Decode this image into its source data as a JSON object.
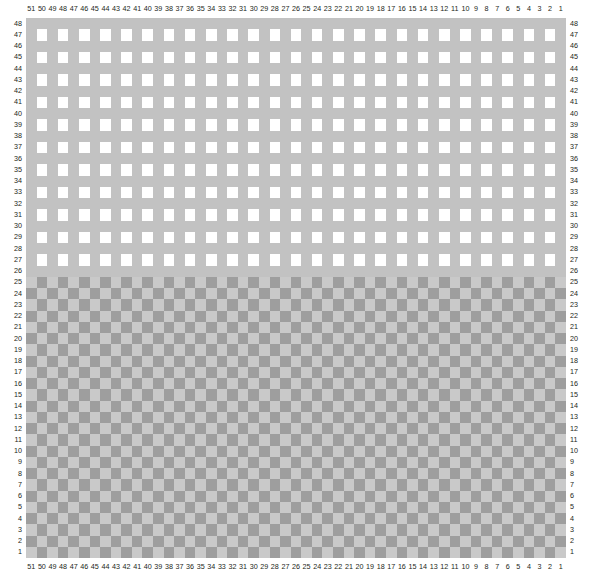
{
  "chart_data": {
    "type": "heatmap",
    "title": "",
    "subtitle": "",
    "xlabel": "",
    "ylabel": "",
    "grid": true,
    "legend": null,
    "legend_position": "none",
    "n_cols": 51,
    "n_rows": 48,
    "x_axis": {
      "position": "top-and-bottom",
      "direction": "descending-left-to-right",
      "range": [
        51,
        1
      ],
      "tick_labels": [
        "51",
        "50",
        "49",
        "48",
        "47",
        "46",
        "45",
        "44",
        "43",
        "42",
        "41",
        "40",
        "39",
        "38",
        "37",
        "36",
        "35",
        "34",
        "33",
        "32",
        "31",
        "30",
        "29",
        "28",
        "27",
        "26",
        "25",
        "24",
        "23",
        "22",
        "21",
        "20",
        "19",
        "18",
        "17",
        "16",
        "15",
        "14",
        "13",
        "12",
        "11",
        "10",
        "9",
        "8",
        "7",
        "6",
        "5",
        "4",
        "3",
        "2",
        "1"
      ]
    },
    "y_axis": {
      "position": "left-and-right",
      "direction": "descending-top-to-bottom",
      "range": [
        48,
        1
      ],
      "tick_labels": [
        "48",
        "47",
        "46",
        "45",
        "44",
        "43",
        "42",
        "41",
        "40",
        "39",
        "38",
        "37",
        "36",
        "35",
        "34",
        "33",
        "32",
        "31",
        "30",
        "29",
        "28",
        "27",
        "26",
        "25",
        "24",
        "23",
        "22",
        "21",
        "20",
        "19",
        "18",
        "17",
        "16",
        "15",
        "14",
        "13",
        "12",
        "11",
        "10",
        "9",
        "8",
        "7",
        "6",
        "5",
        "4",
        "3",
        "2",
        "1"
      ]
    },
    "regions": [
      {
        "name": "coarse-checkerboard-block",
        "row_range": [
          27,
          48
        ],
        "description": "alternating gray and white checkerboard; even rows solid gray, odd rows gray/white alternating",
        "colors": {
          "filled": "#c2c2c2",
          "empty": "#ffffff"
        }
      },
      {
        "name": "divider-row",
        "row_range": [
          26,
          26
        ],
        "description": "uniform gray separator row",
        "colors": {
          "filled": "#c2c2c2"
        }
      },
      {
        "name": "fine-texture-block",
        "row_range": [
          1,
          25
        ],
        "description": "dense checkerboard of light and mid gray cells with fine vertical sub-striping",
        "colors": {
          "light": "#c9c9c9",
          "dark": "#9e9e9e"
        }
      }
    ],
    "colors": {
      "gray_fill": "#c2c2c2",
      "white_fill": "#ffffff",
      "fine_light": "#c9c9c9",
      "fine_dark": "#9e9e9e",
      "axis_text": "#231f20",
      "background": "#ffffff"
    }
  }
}
